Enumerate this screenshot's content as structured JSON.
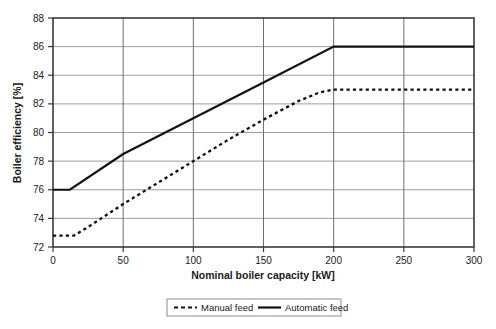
{
  "chart_data": {
    "type": "line",
    "title": "",
    "xlabel": "Nominal boiler capacity [kW]",
    "ylabel": "Boiler efficiency [%]",
    "xlim": [
      0,
      300
    ],
    "ylim": [
      72,
      88
    ],
    "xticks": [
      0,
      50,
      100,
      150,
      200,
      250,
      300
    ],
    "yticks": [
      72,
      74,
      76,
      78,
      80,
      82,
      84,
      86,
      88
    ],
    "xtick_labels": [
      "0",
      "50",
      "100",
      "150",
      "200",
      "250",
      "300"
    ],
    "ytick_labels": [
      "72",
      "74",
      "76",
      "78",
      "80",
      "82",
      "84",
      "86",
      "88"
    ],
    "grid": true,
    "legend_position": "bottom",
    "series": [
      {
        "name": "Manual feed",
        "style": "dashed",
        "color": "#111111",
        "x": [
          0,
          15,
          25,
          50,
          75,
          100,
          125,
          150,
          175,
          190,
          200,
          250,
          300
        ],
        "y": [
          72.8,
          72.8,
          73.4,
          75.0,
          76.5,
          78.0,
          79.5,
          80.9,
          82.2,
          82.8,
          83.0,
          83.0,
          83.0
        ]
      },
      {
        "name": "Automatic feed",
        "style": "solid",
        "color": "#111111",
        "x": [
          0,
          12,
          50,
          100,
          150,
          200,
          250,
          300
        ],
        "y": [
          76.0,
          76.0,
          78.5,
          81.0,
          83.5,
          86.0,
          86.0,
          86.0
        ]
      }
    ]
  },
  "legend": {
    "items": [
      {
        "label": "Manual feed",
        "style": "dashed"
      },
      {
        "label": "Automatic feed",
        "style": "solid"
      }
    ]
  },
  "axes": {
    "x_title": "Nominal boiler capacity [kW]",
    "y_title": "Boiler efficiency [%]"
  }
}
